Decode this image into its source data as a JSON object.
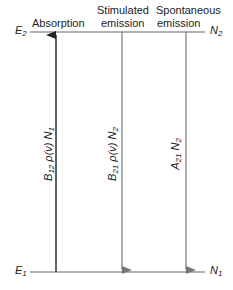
{
  "levels": {
    "upper": {
      "energy": "E",
      "energy_sub": "2",
      "population": "N",
      "population_sub": "2"
    },
    "lower": {
      "energy": "E",
      "energy_sub": "1",
      "population": "N",
      "population_sub": "1"
    }
  },
  "processes": [
    {
      "title_line1": "",
      "title_line2": "Absorption",
      "rate_main": "B",
      "rate_sub": "12",
      "rate_mid": " ρ(ν) ",
      "rate_pop": "N",
      "rate_pop_sub": "1",
      "direction": "up"
    },
    {
      "title_line1": "Stimulated",
      "title_line2": "emission",
      "rate_main": "B",
      "rate_sub": "21",
      "rate_mid": " ρ(ν) ",
      "rate_pop": "N",
      "rate_pop_sub": "2",
      "direction": "down"
    },
    {
      "title_line1": "Spontaneous",
      "title_line2": "emission",
      "rate_main": "A",
      "rate_sub": "21",
      "rate_mid": " ",
      "rate_pop": "N",
      "rate_pop_sub": "2",
      "direction": "down"
    }
  ],
  "colors": {
    "absorption_arrow": "#222222",
    "emission_arrow": "#777777",
    "level_line": "#666666"
  }
}
